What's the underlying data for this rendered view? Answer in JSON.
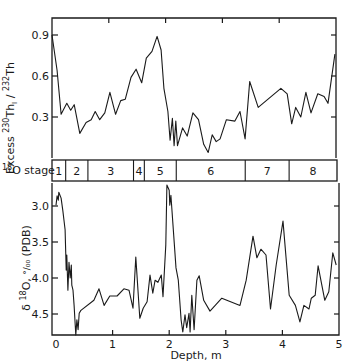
{
  "chart_data": [
    {
      "type": "line",
      "panel": "top",
      "title": "",
      "xlabel": "Depth, m",
      "ylabel": "Excess 230Th1 / 232Th",
      "ylabel_parts": {
        "main": "Excess ",
        "sup1": "230",
        "mid": "Th",
        "sub": "I",
        "slash": " / ",
        "sup2": "232",
        "end": "Th"
      },
      "xlim": [
        0,
        5
      ],
      "ylim": [
        0.0,
        1.03
      ],
      "yticks": [
        0.3,
        0.6,
        0.9
      ],
      "ytick_labels": [
        "0.3",
        "0.6",
        "0.9"
      ],
      "xticks": [
        1,
        2,
        3,
        4
      ],
      "grid": false,
      "series": [
        {
          "name": "Excess 230Th/232Th",
          "x": [
            0.0,
            0.09,
            0.16,
            0.26,
            0.33,
            0.39,
            0.49,
            0.6,
            0.69,
            0.76,
            0.84,
            0.93,
            1.02,
            1.12,
            1.21,
            1.29,
            1.39,
            1.48,
            1.58,
            1.66,
            1.76,
            1.85,
            1.92,
            1.97,
            2.04,
            2.08,
            2.12,
            2.15,
            2.18,
            2.21,
            2.3,
            2.38,
            2.48,
            2.58,
            2.67,
            2.75,
            2.82,
            2.89,
            2.96,
            3.07,
            3.22,
            3.31,
            3.4,
            3.48,
            3.63,
            4.03,
            4.14,
            4.22,
            4.29,
            4.38,
            4.47,
            4.56,
            4.68,
            4.79,
            4.86,
            4.98
          ],
          "values": [
            0.9,
            0.64,
            0.32,
            0.4,
            0.35,
            0.39,
            0.18,
            0.26,
            0.28,
            0.34,
            0.28,
            0.33,
            0.48,
            0.32,
            0.42,
            0.43,
            0.59,
            0.65,
            0.55,
            0.73,
            0.78,
            0.89,
            0.79,
            0.51,
            0.34,
            0.13,
            0.29,
            0.09,
            0.27,
            0.09,
            0.22,
            0.16,
            0.33,
            0.28,
            0.1,
            0.04,
            0.17,
            0.12,
            0.14,
            0.28,
            0.27,
            0.34,
            0.14,
            0.56,
            0.37,
            0.51,
            0.47,
            0.25,
            0.37,
            0.3,
            0.48,
            0.33,
            0.47,
            0.45,
            0.4,
            0.76,
            0.33
          ]
        }
      ]
    },
    {
      "type": "table",
      "panel": "stage-band",
      "label": "18O stage",
      "label_parts": {
        "sup": "18",
        "main": "O stage"
      },
      "stages": [
        {
          "label": "1",
          "from": 0.0,
          "to": 0.24
        },
        {
          "label": "2",
          "from": 0.24,
          "to": 0.63
        },
        {
          "label": "3",
          "from": 0.63,
          "to": 1.43
        },
        {
          "label": "4",
          "from": 1.43,
          "to": 1.62
        },
        {
          "label": "5",
          "from": 1.62,
          "to": 2.18
        },
        {
          "label": "6",
          "from": 2.18,
          "to": 3.39
        },
        {
          "label": "7",
          "from": 3.39,
          "to": 4.16
        },
        {
          "label": "8",
          "from": 4.16,
          "to": 5.0
        }
      ]
    },
    {
      "type": "line",
      "panel": "bottom",
      "title": "",
      "xlabel": "Depth, m",
      "ylabel": "δ18O, ‰ (PDB)",
      "ylabel_parts": {
        "delta": "δ ",
        "sup": "18",
        "main": "O, ",
        "permil": "°/₀₀",
        "end": " (PDB)"
      },
      "xlim": [
        0,
        5
      ],
      "ylim": [
        4.8,
        2.72
      ],
      "y_inverted": true,
      "yticks": [
        3.0,
        3.5,
        4.0,
        4.5
      ],
      "ytick_labels": [
        "3.0",
        "3.5",
        "4.0",
        "4.5"
      ],
      "xticks": [
        0,
        1,
        2,
        3,
        4,
        5
      ],
      "xtick_labels": [
        "0",
        "1",
        "2",
        "3",
        "4",
        "5"
      ],
      "grid": false,
      "series": [
        {
          "name": "δ18O",
          "x": [
            0.0,
            0.02,
            0.04,
            0.05,
            0.09,
            0.12,
            0.16,
            0.18,
            0.19,
            0.21,
            0.23,
            0.25,
            0.27,
            0.28,
            0.3,
            0.32,
            0.34,
            0.35,
            0.37,
            0.39,
            0.41,
            0.44,
            0.67,
            0.76,
            0.85,
            0.95,
            1.08,
            1.2,
            1.29,
            1.36,
            1.41,
            1.48,
            1.54,
            1.61,
            1.66,
            1.71,
            1.75,
            1.8,
            1.86,
            1.89,
            1.94,
            1.96,
            2.0,
            2.01,
            2.03,
            2.12,
            2.16,
            2.21,
            2.24,
            2.28,
            2.31,
            2.35,
            2.37,
            2.4,
            2.44,
            2.49,
            2.53,
            2.61,
            2.72,
            2.93,
            3.25,
            3.36,
            3.48,
            3.55,
            3.62,
            3.71,
            3.79,
            3.89,
            4.01,
            4.12,
            4.23,
            4.31,
            4.38,
            4.47,
            4.51,
            4.58,
            4.63,
            4.75,
            4.82,
            4.89,
            4.95
          ],
          "values": [
            2.99,
            2.86,
            2.92,
            2.81,
            2.89,
            3.06,
            3.33,
            3.89,
            3.68,
            4.17,
            3.78,
            4.0,
            3.82,
            4.1,
            4.17,
            4.38,
            4.65,
            4.79,
            4.58,
            4.72,
            4.49,
            4.45,
            4.31,
            4.15,
            4.38,
            4.25,
            4.25,
            4.15,
            4.17,
            4.42,
            3.71,
            4.56,
            4.42,
            4.33,
            3.96,
            4.21,
            4.03,
            4.06,
            3.96,
            4.26,
            3.54,
            2.71,
            2.78,
            2.99,
            2.85,
            3.86,
            4.03,
            4.58,
            4.75,
            4.51,
            4.69,
            4.49,
            4.75,
            4.24,
            4.72,
            4.03,
            3.97,
            4.31,
            4.46,
            4.28,
            4.38,
            4.03,
            3.42,
            3.72,
            3.6,
            3.68,
            4.43,
            3.82,
            3.21,
            4.24,
            4.38,
            4.61,
            4.38,
            4.43,
            4.28,
            4.24,
            3.83,
            4.31,
            4.19,
            3.65,
            3.82
          ]
        }
      ]
    }
  ],
  "labels": {
    "top_ylabel": "Excess",
    "stage_label": "O stage",
    "stage_sup": "18",
    "bottom_xlabel": "Depth, m"
  }
}
